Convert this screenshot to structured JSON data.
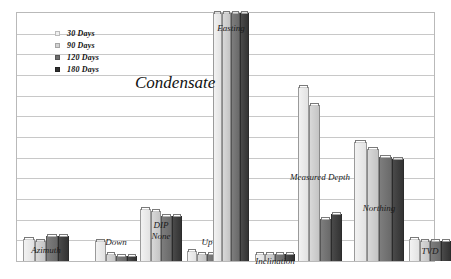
{
  "chart_data": {
    "type": "bar",
    "title": "Condensate",
    "xlabel": "",
    "ylabel": "",
    "ylim": [
      0,
      100
    ],
    "grid": true,
    "gridline_count": 11,
    "legend_position": "top-left",
    "group_header": "DIP",
    "categories": [
      "Azimuth",
      "Down",
      "None",
      "Up",
      "Easting",
      "Inclination",
      "Measured Depth",
      "Northing",
      "TVD"
    ],
    "series": [
      {
        "name": "30 Days",
        "values": [
          9,
          8,
          21,
          4,
          100,
          3,
          70,
          48,
          9
        ]
      },
      {
        "name": "90 Days",
        "values": [
          8,
          3,
          20,
          3,
          100,
          3,
          63,
          45,
          8
        ]
      },
      {
        "name": "120 Days",
        "values": [
          10,
          2,
          18,
          3,
          100,
          3,
          17,
          42,
          8
        ]
      },
      {
        "name": "180 Days",
        "values": [
          10,
          2,
          18,
          3,
          100,
          3,
          19,
          41,
          8
        ]
      }
    ]
  },
  "legend": {
    "items": [
      {
        "label": "30 Days"
      },
      {
        "label": "90 Days"
      },
      {
        "label": "120 Days"
      },
      {
        "label": "180 Days"
      }
    ]
  },
  "axis": {
    "tick_labels": []
  }
}
